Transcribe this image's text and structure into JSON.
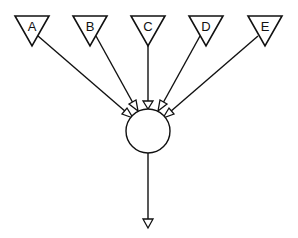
{
  "diagram": {
    "type": "fan-in",
    "inputs": [
      {
        "label": "A"
      },
      {
        "label": "B"
      },
      {
        "label": "C"
      },
      {
        "label": "D"
      },
      {
        "label": "E"
      }
    ],
    "hub": {
      "shape": "circle",
      "label": ""
    },
    "output": {
      "shape": "open-arrowhead",
      "label": ""
    },
    "colors": {
      "stroke": "#111111",
      "fill": "#ffffff",
      "background": "#ffffff"
    }
  }
}
